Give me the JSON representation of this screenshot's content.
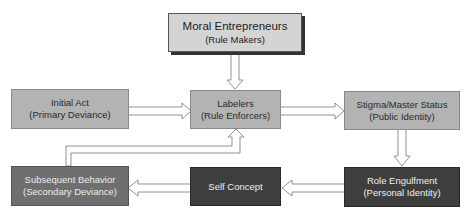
{
  "diagram": {
    "nodes": {
      "moral_entrepreneurs": {
        "title": "Moral Entrepreneurs",
        "subtitle": "(Rule Makers)"
      },
      "initial_act": {
        "title": "Initial Act",
        "subtitle": "(Primary Deviance)"
      },
      "labelers": {
        "title": "Labelers",
        "subtitle": "(Rule Enforcers)"
      },
      "stigma": {
        "title": "Stigma/Master Status",
        "subtitle": "(Public Identity)"
      },
      "subsequent_behavior": {
        "title": "Subsequent Behavior",
        "subtitle": "(Secondary Deviance)"
      },
      "self_concept": {
        "title": "Self Concept"
      },
      "role_engulfment": {
        "title": "Role Engulfment",
        "subtitle": "(Personal Identity)"
      }
    },
    "edges": [
      {
        "from": "Moral Entrepreneurs",
        "to": "Labelers"
      },
      {
        "from": "Initial Act",
        "to": "Labelers"
      },
      {
        "from": "Labelers",
        "to": "Stigma/Master Status"
      },
      {
        "from": "Stigma/Master Status",
        "to": "Role Engulfment"
      },
      {
        "from": "Role Engulfment",
        "to": "Self Concept"
      },
      {
        "from": "Self Concept",
        "to": "Subsequent Behavior"
      },
      {
        "from": "Subsequent Behavior",
        "to": "Labelers"
      }
    ],
    "colors": {
      "light": "#b3b3b3",
      "top": "#d4d4d4",
      "mid": "#6f6f6f",
      "dark": "#3e3e3e"
    }
  }
}
